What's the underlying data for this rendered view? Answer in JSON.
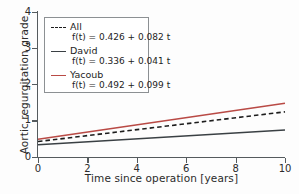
{
  "chart_data": {
    "type": "line",
    "title": "",
    "xlabel": "Time since operation [years]",
    "ylabel": "Aortic regurgitation grade",
    "xlim": [
      0,
      10
    ],
    "ylim": [
      0,
      4
    ],
    "xticks": [
      "0",
      "2",
      "4",
      "6",
      "8",
      "10"
    ],
    "xtick_values": [
      0,
      2,
      4,
      6,
      8,
      10
    ],
    "yticks": [
      "0",
      "1",
      "2",
      "3",
      "4"
    ],
    "ytick_values": [
      0,
      1,
      2,
      3,
      4
    ],
    "grid": false,
    "legend_position": "upper left",
    "series": [
      {
        "name": "All",
        "equation": "f(t) = 0.426 + 0.082 t",
        "intercept": 0.426,
        "slope": 0.082,
        "x": [
          0,
          10
        ],
        "values": [
          0.426,
          1.246
        ],
        "color": "#1d1d1d",
        "style": "dashed"
      },
      {
        "name": "David",
        "equation": "f(t) = 0.336 + 0.041 t",
        "intercept": 0.336,
        "slope": 0.041,
        "x": [
          0,
          10
        ],
        "values": [
          0.336,
          0.746
        ],
        "color": "#3a4044",
        "style": "solid"
      },
      {
        "name": "Yacoub",
        "equation": "f(t) = 0.492 + 0.099 t",
        "intercept": 0.492,
        "slope": 0.099,
        "x": [
          0,
          10
        ],
        "values": [
          0.492,
          1.482
        ],
        "color": "#b94a45",
        "style": "solid"
      }
    ]
  },
  "axes": {
    "x_label": "Time since operation [years]",
    "y_label": "Aortic regurgitation grade",
    "x_ticks": [
      "0",
      "2",
      "4",
      "6",
      "8",
      "10"
    ],
    "y_ticks": [
      "0",
      "1",
      "2",
      "3",
      "4"
    ]
  },
  "legend": {
    "entries": [
      {
        "name": "All",
        "equation": "f(t) = 0.426 + 0.082 t"
      },
      {
        "name": "David",
        "equation": "f(t) = 0.336 + 0.041 t"
      },
      {
        "name": "Yacoub",
        "equation": "f(t) = 0.492 + 0.099 t"
      }
    ]
  },
  "colors": {
    "all": "#1d1d1d",
    "david": "#3a4044",
    "yacoub": "#b94a45",
    "axis": "#555b5e",
    "text": "#2b2b2b",
    "background": "#fdfdfd"
  }
}
